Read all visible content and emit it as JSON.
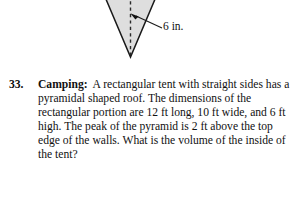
{
  "figure": {
    "shape_name": "inverted-pyramid-cross-section",
    "fill_color": "#dedede",
    "stroke_color": "#1a1a1a",
    "center_line_style": "dashed",
    "dimension_label": "6 in.",
    "callout": "leader-line-with-arrow"
  },
  "problem": {
    "number": "33.",
    "topic": "Camping:",
    "text": "A rectangular tent with straight sides has a pyramidal shaped roof.  The dimensions of the rectangular portion are 12 ft long, 10 ft wide, and 6 ft high.  The peak of the pyramid is 2 ft above the top edge of the walls.  What is the volume of the inside of the tent?"
  }
}
